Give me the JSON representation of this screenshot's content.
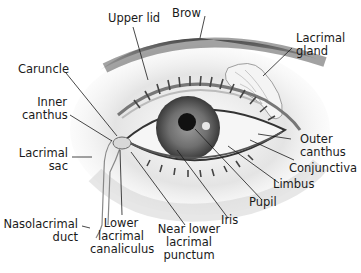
{
  "diagram": {
    "labels": {
      "upper_lid": "Upper lid",
      "brow": "Brow",
      "lacrimal_gland": "Lacrimal\ngland",
      "caruncle": "Caruncle",
      "inner_canthus": "Inner\ncanthus",
      "outer_canthus": "Outer\ncanthus",
      "conjunctiva": "Conjunctiva",
      "lacrimal_sac": "Lacrimal\nsac",
      "limbus": "Limbus",
      "pupil": "Pupil",
      "iris": "Iris",
      "nasolacrimal_duct": "Nasolacrimal\nduct",
      "lower_lacrimal_canaliculus": "Lower\nlacrimal\ncanaliculus",
      "near_lower_lacrimal_punctum": "Near lower\nlacrimal\npunctum"
    },
    "colors": {
      "line": "#1a1a1a",
      "skin_shadow": "#6e6e6e",
      "iris": "#707070",
      "pupil": "#111111"
    }
  }
}
